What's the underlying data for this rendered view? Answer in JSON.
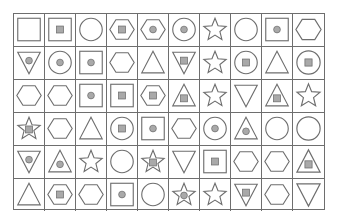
{
  "puzzle": {
    "rows": 6,
    "cols": 10,
    "colors": {
      "stroke": "#6e6e6e",
      "inner_fill": "#a9a9a9",
      "background": "#ffffff",
      "grid_line": "#6e6e6e"
    },
    "cells": [
      [
        {
          "shape": "square",
          "inner": "none"
        },
        {
          "shape": "square",
          "inner": "square"
        },
        {
          "shape": "circle",
          "inner": "none"
        },
        {
          "shape": "hexagon",
          "inner": "square"
        },
        {
          "shape": "hexagon",
          "inner": "dot"
        },
        {
          "shape": "circle",
          "inner": "dot"
        },
        {
          "shape": "star",
          "inner": "none"
        },
        {
          "shape": "circle",
          "inner": "none"
        },
        {
          "shape": "square",
          "inner": "dot"
        },
        {
          "shape": "hexagon",
          "inner": "none"
        }
      ],
      [
        {
          "shape": "triangle-down",
          "inner": "dot"
        },
        {
          "shape": "circle",
          "inner": "dot"
        },
        {
          "shape": "square",
          "inner": "dot"
        },
        {
          "shape": "hexagon",
          "inner": "none"
        },
        {
          "shape": "triangle-up",
          "inner": "none"
        },
        {
          "shape": "triangle-down",
          "inner": "square"
        },
        {
          "shape": "star",
          "inner": "none"
        },
        {
          "shape": "circle",
          "inner": "square"
        },
        {
          "shape": "triangle-up",
          "inner": "none"
        },
        {
          "shape": "circle",
          "inner": "square"
        }
      ],
      [
        {
          "shape": "hexagon",
          "inner": "none"
        },
        {
          "shape": "hexagon",
          "inner": "none"
        },
        {
          "shape": "square",
          "inner": "dot"
        },
        {
          "shape": "square",
          "inner": "square"
        },
        {
          "shape": "hexagon",
          "inner": "square"
        },
        {
          "shape": "triangle-up",
          "inner": "square"
        },
        {
          "shape": "star",
          "inner": "none"
        },
        {
          "shape": "triangle-down",
          "inner": "none"
        },
        {
          "shape": "triangle-up",
          "inner": "square"
        },
        {
          "shape": "star",
          "inner": "none"
        }
      ],
      [
        {
          "shape": "star",
          "inner": "square"
        },
        {
          "shape": "hexagon",
          "inner": "none"
        },
        {
          "shape": "triangle-up",
          "inner": "none"
        },
        {
          "shape": "circle",
          "inner": "square"
        },
        {
          "shape": "square",
          "inner": "dot"
        },
        {
          "shape": "hexagon",
          "inner": "none"
        },
        {
          "shape": "circle",
          "inner": "dot"
        },
        {
          "shape": "triangle-up",
          "inner": "dot"
        },
        {
          "shape": "circle",
          "inner": "none"
        },
        {
          "shape": "circle",
          "inner": "none"
        }
      ],
      [
        {
          "shape": "triangle-down",
          "inner": "dot"
        },
        {
          "shape": "triangle-up",
          "inner": "dot"
        },
        {
          "shape": "star",
          "inner": "none"
        },
        {
          "shape": "circle",
          "inner": "none"
        },
        {
          "shape": "star",
          "inner": "square"
        },
        {
          "shape": "triangle-down",
          "inner": "none"
        },
        {
          "shape": "square",
          "inner": "square"
        },
        {
          "shape": "hexagon",
          "inner": "none"
        },
        {
          "shape": "hexagon",
          "inner": "none"
        },
        {
          "shape": "triangle-up",
          "inner": "square"
        }
      ],
      [
        {
          "shape": "triangle-up",
          "inner": "none"
        },
        {
          "shape": "hexagon",
          "inner": "square"
        },
        {
          "shape": "hexagon",
          "inner": "none"
        },
        {
          "shape": "square",
          "inner": "dot"
        },
        {
          "shape": "circle",
          "inner": "none"
        },
        {
          "shape": "star",
          "inner": "dot"
        },
        {
          "shape": "star",
          "inner": "none"
        },
        {
          "shape": "triangle-down",
          "inner": "square"
        },
        {
          "shape": "hexagon",
          "inner": "none"
        },
        {
          "shape": "triangle-down",
          "inner": "none"
        }
      ]
    ]
  }
}
